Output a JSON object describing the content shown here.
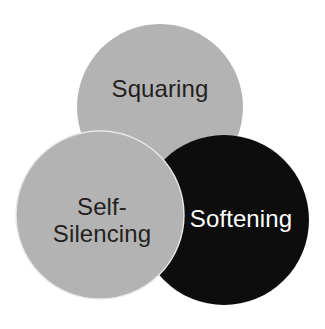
{
  "diagram": {
    "type": "venn-three-circle",
    "background_color": "#ffffff",
    "circles": [
      {
        "id": "squaring",
        "label": "Squaring",
        "fill_color": "#b3b3b3",
        "text_color": "#231f20",
        "center_x": 160,
        "center_y": 107,
        "radius": 83,
        "stack_order": 1
      },
      {
        "id": "softening",
        "label": "Softening",
        "fill_color": "#0d0d0d",
        "text_color": "#ffffff",
        "center_x": 224,
        "center_y": 220,
        "radius": 85,
        "stack_order": 2
      },
      {
        "id": "self-silencing",
        "label": "Self-\nSilencing",
        "label_line_1": "Self-",
        "label_line_2": "Silencing",
        "fill_color": "#b3b3b3",
        "text_color": "#231f20",
        "center_x": 100,
        "center_y": 215,
        "radius": 84,
        "stack_order": 3
      }
    ]
  }
}
